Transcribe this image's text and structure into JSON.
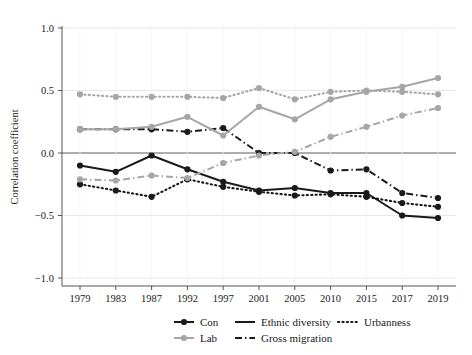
{
  "chart_data": {
    "type": "line",
    "title": "",
    "xlabel": "",
    "ylabel": "Correlation coefficient",
    "ylim": [
      -1.0,
      1.0
    ],
    "ytick_labels": [
      "1.0",
      "0.5",
      "0.0",
      "-0.5",
      "-1.0"
    ],
    "ytick_values": [
      1.0,
      0.5,
      0.0,
      -0.5,
      -1.0
    ],
    "grid": true,
    "legend_position": "bottom",
    "categories": [
      "1979",
      "1983",
      "1987",
      "1992",
      "1997",
      "2001",
      "2005",
      "2010",
      "2015",
      "2017",
      "2019"
    ],
    "x": [
      1979,
      1983,
      1987,
      1992,
      1997,
      2001,
      2005,
      2010,
      2015,
      2017,
      2019
    ],
    "legend_color_entries": [
      {
        "key": "con",
        "label": "Con",
        "color": "#1a1a1a"
      },
      {
        "key": "lab",
        "label": "Lab",
        "color": "#a6a6a6"
      }
    ],
    "legend_style_entries": [
      {
        "key": "ethnic_diversity",
        "label": "Ethnic diversity",
        "dash": "solid"
      },
      {
        "key": "gross_migration",
        "label": "Gross migration",
        "dash": "dashdot"
      },
      {
        "key": "urbanness",
        "label": "Urbanness",
        "dash": "dotted"
      }
    ],
    "series": [
      {
        "name": "Con × Ethnic diversity",
        "party": "Con",
        "variable": "Ethnic diversity",
        "color": "#1a1a1a",
        "dash": "solid",
        "values": [
          -0.1,
          -0.15,
          -0.02,
          -0.13,
          -0.23,
          -0.3,
          -0.28,
          -0.32,
          -0.32,
          -0.5,
          -0.52
        ]
      },
      {
        "name": "Con × Gross migration",
        "party": "Con",
        "variable": "Gross migration",
        "color": "#1a1a1a",
        "dash": "dashdot",
        "values": [
          0.19,
          0.19,
          0.19,
          0.17,
          0.2,
          0.0,
          0.0,
          -0.14,
          -0.13,
          -0.32,
          -0.36
        ]
      },
      {
        "name": "Con × Urbanness",
        "party": "Con",
        "variable": "Urbanness",
        "color": "#1a1a1a",
        "dash": "dotted",
        "values": [
          -0.25,
          -0.3,
          -0.35,
          -0.21,
          -0.27,
          -0.31,
          -0.34,
          -0.33,
          -0.35,
          -0.4,
          -0.43
        ]
      },
      {
        "name": "Lab × Ethnic diversity",
        "party": "Lab",
        "variable": "Ethnic diversity",
        "color": "#a6a6a6",
        "dash": "solid",
        "values": [
          0.19,
          0.19,
          0.21,
          0.29,
          0.14,
          0.37,
          0.27,
          0.43,
          0.49,
          0.53,
          0.6
        ]
      },
      {
        "name": "Lab × Gross migration",
        "party": "Lab",
        "variable": "Gross migration",
        "color": "#a6a6a6",
        "dash": "dashdot",
        "values": [
          -0.21,
          -0.22,
          -0.18,
          -0.2,
          -0.08,
          -0.02,
          0.01,
          0.13,
          0.21,
          0.3,
          0.36
        ]
      },
      {
        "name": "Lab × Urbanness",
        "party": "Lab",
        "variable": "Urbanness",
        "color": "#a6a6a6",
        "dash": "dotted",
        "values": [
          0.47,
          0.45,
          0.45,
          0.45,
          0.44,
          0.52,
          0.43,
          0.49,
          0.5,
          0.49,
          0.47
        ]
      }
    ]
  }
}
